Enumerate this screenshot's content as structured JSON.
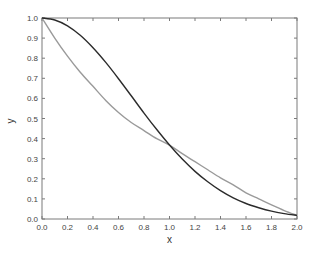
{
  "chart_data": {
    "type": "line",
    "title": "",
    "xlabel": "x",
    "ylabel": "y",
    "xlim": [
      0.0,
      2.0
    ],
    "ylim": [
      0.0,
      1.0
    ],
    "grid": false,
    "legend": null,
    "x_ticks": [
      "0.0",
      "0.2",
      "0.4",
      "0.6",
      "0.8",
      "1.0",
      "1.2",
      "1.4",
      "1.6",
      "1.8",
      "2.0"
    ],
    "y_ticks": [
      "0.0",
      "0.1",
      "0.2",
      "0.3",
      "0.4",
      "0.5",
      "0.6",
      "0.7",
      "0.8",
      "0.9",
      "1.0"
    ],
    "x": [
      0.0,
      0.1,
      0.2,
      0.3,
      0.4,
      0.5,
      0.6,
      0.7,
      0.8,
      0.9,
      1.0,
      1.1,
      1.2,
      1.3,
      1.4,
      1.5,
      1.6,
      1.7,
      1.8,
      1.9,
      2.0
    ],
    "series": [
      {
        "name": "dark curve",
        "color": "#2b2b2b",
        "values": [
          1.0,
          0.99,
          0.961,
          0.914,
          0.852,
          0.779,
          0.698,
          0.613,
          0.527,
          0.445,
          0.368,
          0.298,
          0.237,
          0.185,
          0.141,
          0.105,
          0.077,
          0.056,
          0.039,
          0.027,
          0.018
        ]
      },
      {
        "name": "gray curve",
        "color": "#9a9a9a",
        "values": [
          1.0,
          0.9,
          0.81,
          0.73,
          0.66,
          0.59,
          0.53,
          0.48,
          0.44,
          0.4,
          0.368,
          0.325,
          0.285,
          0.245,
          0.205,
          0.17,
          0.13,
          0.1,
          0.07,
          0.042,
          0.018
        ]
      }
    ]
  }
}
